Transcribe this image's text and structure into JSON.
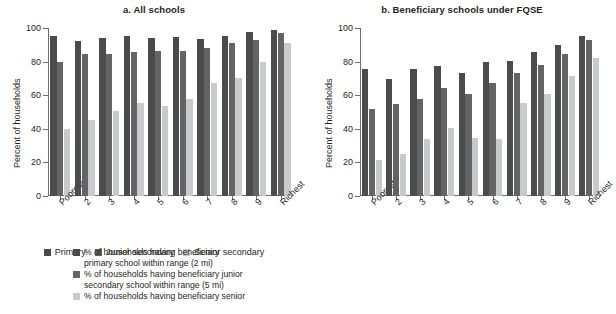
{
  "figure": {
    "panels": [
      {
        "key": "a",
        "title": "a. All schools",
        "ylabel": "Percent of households"
      },
      {
        "key": "b",
        "title": "b. Beneficiary schools under FQSE",
        "ylabel": "Percent of households"
      }
    ],
    "legend_a": [
      {
        "label": "Primary",
        "color": "#4b4b4d"
      },
      {
        "label": "Junior secondary",
        "color": "#646466"
      },
      {
        "label": "Senior secondary",
        "color": "#c9cacc"
      }
    ],
    "legend_b": [
      {
        "line1": "% of households having beneficiary",
        "line2": "primary school within range (2 mi)",
        "color": "#4b4b4d"
      },
      {
        "line1": "% of households having beneficiary junior",
        "line2": "secondary school within range (5 mi)",
        "color": "#646466"
      },
      {
        "line1": "% of households having beneficiary senior",
        "line2": "",
        "color": "#c9cacc"
      }
    ]
  },
  "chart_data": [
    {
      "type": "bar",
      "title": "a. All schools",
      "xlabel": "",
      "ylabel": "Percent of households",
      "ylim": [
        0,
        100
      ],
      "yticks": [
        0,
        20,
        40,
        60,
        80,
        100
      ],
      "grid": false,
      "legend_position": "bottom",
      "categories": [
        "Poorest",
        "2",
        "3",
        "4",
        "5",
        "6",
        "7",
        "8",
        "9",
        "Richest"
      ],
      "series": [
        {
          "name": "Primary",
          "color": "#4b4b4d",
          "values": [
            95,
            92,
            94,
            95,
            94,
            94.5,
            93.5,
            95.5,
            97.5,
            99
          ]
        },
        {
          "name": "Junior secondary",
          "color": "#646466",
          "values": [
            79.5,
            84.5,
            84.5,
            86,
            86.5,
            86.5,
            88,
            91,
            93,
            97
          ]
        },
        {
          "name": "Senior secondary",
          "color": "#c9cacc",
          "values": [
            40,
            45.5,
            50.5,
            55.5,
            53.5,
            57.5,
            67,
            70.5,
            80,
            91
          ]
        }
      ]
    },
    {
      "type": "bar",
      "title": "b. Beneficiary schools under FQSE",
      "xlabel": "",
      "ylabel": "Percent of households",
      "ylim": [
        0,
        100
      ],
      "yticks": [
        0,
        20,
        40,
        60,
        80,
        100
      ],
      "grid": false,
      "legend_position": "bottom",
      "categories": [
        "Poorest",
        "2",
        "3",
        "4",
        "5",
        "6",
        "7",
        "8",
        "9",
        "Richest"
      ],
      "series": [
        {
          "name": "% of households having beneficiary primary school within range (2 mi)",
          "color": "#4b4b4d",
          "values": [
            75.5,
            69.5,
            75.5,
            77.5,
            73.5,
            80,
            80.5,
            85.5,
            90,
            95.5
          ]
        },
        {
          "name": "% of households having beneficiary junior secondary school within range (5 mi)",
          "color": "#646466",
          "values": [
            51.5,
            54.5,
            57.5,
            64,
            61,
            67,
            73.5,
            78,
            84.5,
            93
          ]
        },
        {
          "name": "% of households having beneficiary senior",
          "color": "#c9cacc",
          "values": [
            21.5,
            25,
            34,
            40.5,
            34.5,
            34,
            55.5,
            60.5,
            71.5,
            82
          ]
        }
      ]
    }
  ]
}
